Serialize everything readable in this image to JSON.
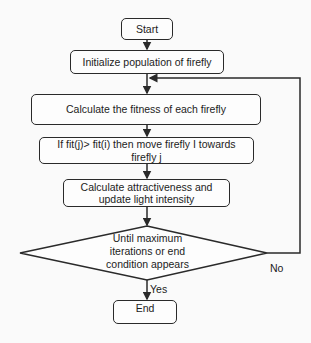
{
  "diagram": {
    "type": "flowchart",
    "nodes": {
      "start": "Start",
      "init": "Initialize population of firefly",
      "fitness": "Calculate the fitness of each firefly",
      "move": "If fit(j)> fit(i) then move firefly I towards firefly j",
      "attract_line1": "Calculate attractiveness and",
      "attract_line2": "update light intensity",
      "decision_line1": "Until maximum",
      "decision_line2": "iterations or end",
      "decision_line3": "condition appears",
      "end": "End"
    },
    "edge_labels": {
      "yes": "Yes",
      "no": "No"
    },
    "edges": [
      {
        "from": "start",
        "to": "init"
      },
      {
        "from": "init",
        "to": "fitness"
      },
      {
        "from": "fitness",
        "to": "move"
      },
      {
        "from": "move",
        "to": "attract"
      },
      {
        "from": "attract",
        "to": "decision"
      },
      {
        "from": "decision",
        "to": "end",
        "label": "Yes"
      },
      {
        "from": "decision",
        "to": "fitness",
        "label": "No"
      }
    ]
  }
}
